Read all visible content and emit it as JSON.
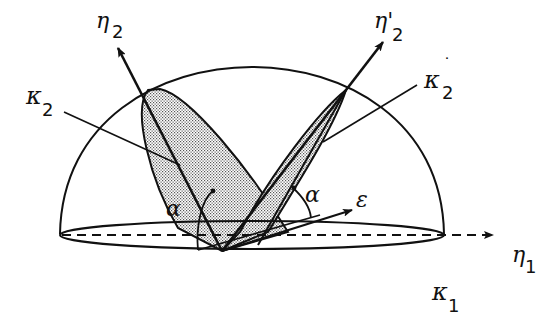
{
  "figure": {
    "type": "geometric-diagram",
    "colors": {
      "stroke": "#111111",
      "shade": "#bdbdbd",
      "background": "#ffffff"
    }
  },
  "labels": {
    "eta2": {
      "symbol": "η",
      "sub": "2"
    },
    "eta2_prime": {
      "symbol": "η'",
      "sub": "2"
    },
    "kappa2": {
      "symbol": "κ",
      "sub": "2"
    },
    "kappa2_prime": {
      "symbol": "κ",
      "sub": "2",
      "mark": "˙"
    },
    "alpha_left": {
      "symbol": "α"
    },
    "alpha_right": {
      "symbol": "α"
    },
    "epsilon": {
      "symbol": "ε"
    },
    "eta1": {
      "symbol": "η",
      "sub": "1"
    },
    "kappa1": {
      "symbol": "κ",
      "sub": "1"
    }
  }
}
